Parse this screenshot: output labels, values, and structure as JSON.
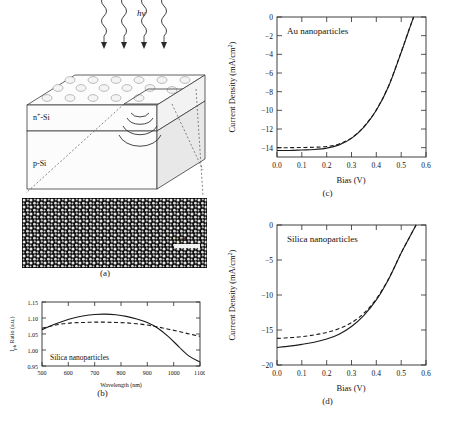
{
  "figure": {
    "panel_a": {
      "label": "(a)",
      "illumination_label": "hv",
      "layer_top_label": "n+-Si",
      "layer_top_label_base": "n",
      "layer_top_label_sup": "+",
      "layer_top_label_rest": "-Si",
      "layer_bottom_label": "p-Si",
      "sem_scale_bar": "1 µm",
      "icons": [
        "photon-wave-icon",
        "arrow-down-icon",
        "nanoparticle-icon",
        "scattering-ripple-icon"
      ]
    },
    "panel_b": {
      "label": "(b)",
      "annotation": "Silica nanoparticles"
    },
    "panel_c": {
      "label": "(c)",
      "annotation": "Au nanoparticles"
    },
    "panel_d": {
      "label": "(d)",
      "annotation": "Silica nanoparticles"
    }
  },
  "chart_data": [
    {
      "id": "panel_b",
      "type": "line",
      "title": "",
      "annotation": "Silica nanoparticles",
      "xlabel": "Wavelength (nm)",
      "ylabel": "Iₚₕ Ratio (a.u.)",
      "ylabel_base": "I",
      "ylabel_sub": "ph",
      "ylabel_rest": " Ratio (a.u.)",
      "xlim": [
        500,
        1100
      ],
      "ylim": [
        0.95,
        1.15
      ],
      "xticks": [
        500,
        600,
        700,
        800,
        900,
        1000,
        1100
      ],
      "yticks": [
        0.95,
        1.0,
        1.05,
        1.1,
        1.15
      ],
      "ytick_labels": [
        "0.95",
        "1.00",
        "1.05",
        "1.10",
        "1.15"
      ],
      "grid": false,
      "legend": "none",
      "series": [
        {
          "name": "solid",
          "style": "solid",
          "x": [
            500,
            540,
            580,
            620,
            660,
            700,
            740,
            780,
            820,
            860,
            900,
            940,
            980,
            1020,
            1060,
            1100
          ],
          "values": [
            1.063,
            1.078,
            1.09,
            1.1,
            1.107,
            1.111,
            1.112,
            1.11,
            1.105,
            1.097,
            1.086,
            1.068,
            1.042,
            1.01,
            0.98,
            0.963
          ]
        },
        {
          "name": "dashed",
          "style": "dashed",
          "x": [
            500,
            540,
            580,
            620,
            660,
            700,
            740,
            780,
            820,
            860,
            900,
            940,
            980,
            1020,
            1060,
            1100
          ],
          "values": [
            1.068,
            1.076,
            1.082,
            1.085,
            1.086,
            1.087,
            1.087,
            1.086,
            1.085,
            1.082,
            1.078,
            1.072,
            1.065,
            1.058,
            1.05,
            1.043
          ]
        }
      ]
    },
    {
      "id": "panel_c",
      "type": "line",
      "title": "",
      "annotation": "Au nanoparticles",
      "xlabel": "Bias (V)",
      "ylabel": "Current Density (mA/cm²)",
      "ylabel_base": "Current Density (mA/cm",
      "ylabel_sup": "2",
      "ylabel_rest": ")",
      "xlim": [
        0.0,
        0.6
      ],
      "ylim": [
        -15,
        0
      ],
      "xticks": [
        0.0,
        0.1,
        0.2,
        0.3,
        0.4,
        0.5,
        0.6
      ],
      "xtick_labels": [
        "0.0",
        "0.1",
        "0.2",
        "0.3",
        "0.4",
        "0.5",
        "0.6"
      ],
      "yticks": [
        0,
        -2,
        -4,
        -6,
        -8,
        -10,
        -12,
        -14
      ],
      "ytick_labels": [
        "0",
        "−2",
        "−4",
        "−6",
        "−8",
        "−10",
        "−12",
        "−14"
      ],
      "grid": false,
      "legend": "none",
      "series": [
        {
          "name": "solid",
          "style": "solid",
          "x": [
            0.0,
            0.05,
            0.1,
            0.15,
            0.2,
            0.25,
            0.3,
            0.35,
            0.4,
            0.45,
            0.5,
            0.525,
            0.55
          ],
          "values": [
            -14.3,
            -14.3,
            -14.25,
            -14.2,
            -14.05,
            -13.7,
            -13.0,
            -11.8,
            -10.0,
            -7.4,
            -3.8,
            -1.9,
            0.0
          ]
        },
        {
          "name": "dashed",
          "style": "dashed",
          "x": [
            0.0,
            0.05,
            0.1,
            0.15,
            0.2,
            0.25,
            0.3,
            0.35,
            0.4,
            0.45,
            0.5,
            0.525,
            0.55
          ],
          "values": [
            -14.0,
            -14.0,
            -13.98,
            -13.95,
            -13.88,
            -13.6,
            -12.95,
            -11.75,
            -9.95,
            -7.35,
            -3.75,
            -1.85,
            0.0
          ]
        }
      ]
    },
    {
      "id": "panel_d",
      "type": "line",
      "title": "",
      "annotation": "Silica nanoparticles",
      "xlabel": "Bias (V)",
      "ylabel": "Current Density (mA/cm²)",
      "ylabel_base": "Current Density (mA/cm",
      "ylabel_sup": "2",
      "ylabel_rest": ")",
      "xlim": [
        0.0,
        0.6
      ],
      "ylim": [
        -20,
        0
      ],
      "xticks": [
        0.0,
        0.1,
        0.2,
        0.3,
        0.4,
        0.5,
        0.6
      ],
      "xtick_labels": [
        "0.0",
        "0.1",
        "0.2",
        "0.3",
        "0.4",
        "0.5",
        "0.6"
      ],
      "yticks": [
        0,
        -5,
        -10,
        -15,
        -20
      ],
      "ytick_labels": [
        "0",
        "−5",
        "−10",
        "−15",
        "−20"
      ],
      "grid": false,
      "legend": "none",
      "series": [
        {
          "name": "solid",
          "style": "solid",
          "x": [
            0.0,
            0.05,
            0.1,
            0.15,
            0.2,
            0.25,
            0.3,
            0.35,
            0.4,
            0.45,
            0.5,
            0.53,
            0.56
          ],
          "values": [
            -17.5,
            -17.3,
            -17.05,
            -16.75,
            -16.3,
            -15.6,
            -14.5,
            -12.9,
            -10.7,
            -7.7,
            -4.0,
            -2.0,
            0.0
          ]
        },
        {
          "name": "dashed",
          "style": "dashed",
          "x": [
            0.0,
            0.05,
            0.1,
            0.15,
            0.2,
            0.25,
            0.3,
            0.35,
            0.4,
            0.45,
            0.5,
            0.53,
            0.56
          ],
          "values": [
            -16.2,
            -16.1,
            -15.95,
            -15.7,
            -15.35,
            -14.8,
            -13.95,
            -12.6,
            -10.55,
            -7.65,
            -3.98,
            -1.99,
            0.0
          ]
        }
      ]
    }
  ]
}
